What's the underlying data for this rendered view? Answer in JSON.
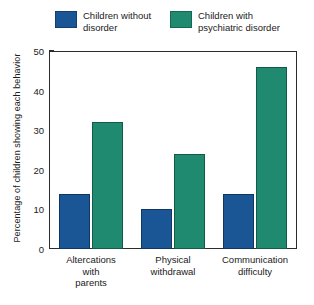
{
  "chart_data": {
    "type": "bar",
    "title": "",
    "xlabel": "",
    "ylabel": "Percentage of children showing each behavior",
    "categories": [
      "Altercations\nwith\nparents",
      "Physical\nwithdrawal",
      "Communication\ndifficulty"
    ],
    "ylim": [
      0,
      50
    ],
    "yticks": [
      0,
      10,
      20,
      30,
      40,
      50
    ],
    "ytick_labels": [
      "0",
      "10",
      "20",
      "30",
      "40",
      "50"
    ],
    "grid": false,
    "legend_position": "top",
    "series": [
      {
        "name": "Children without\ndisorder",
        "color": "#1a5596",
        "values": [
          14,
          10,
          14
        ]
      },
      {
        "name": "Children with\npsychiatric disorder",
        "color": "#1f8a70",
        "values": [
          32,
          24,
          46
        ]
      }
    ]
  },
  "colors": {
    "series_blue": "#1a5596",
    "series_green": "#1f8a70",
    "axis": "#2b2b2b",
    "background": "#ffffff",
    "text": "#1a1a1a"
  }
}
